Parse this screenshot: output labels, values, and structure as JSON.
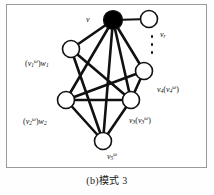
{
  "figure": {
    "caption": "(b)模式 3",
    "panel_border_color": "#9a9a9a",
    "background_color": "#ffffff",
    "node_stroke_color": "#111111",
    "node_fill_color": "#ffffff",
    "filled_node_color": "#000000",
    "edge_color": "#111111"
  },
  "graph_data": {
    "type": "node-link-diagram",
    "nodes": [
      {
        "id": "v",
        "label": "v",
        "label_html": "v",
        "cx": 106,
        "cy": 15,
        "r": 9.5,
        "filled": true,
        "label_x": 79,
        "label_y": 11
      },
      {
        "id": "vr",
        "label": "vr",
        "label_html": "v<sub>r</sub>",
        "cx": 142,
        "cy": 14,
        "r": 8.5,
        "filled": false,
        "label_x": 153,
        "label_y": 26
      },
      {
        "id": "w1",
        "label": "(v1^w)w1",
        "label_html": "<span class=\"paren\">(</span>v<sub>1</sub><sup>ω</sup><span class=\"paren\">)</span>w<sub>1</sub>",
        "cx": 64,
        "cy": 44,
        "r": 8.5,
        "filled": false,
        "label_x": 18,
        "label_y": 54
      },
      {
        "id": "v4",
        "label": "v4(v4^w)",
        "label_html": "v<sub>4</sub><span class=\"paren\">(</span>v<sub>4</sub><sup>ω</sup><span class=\"paren\">)</span>",
        "cx": 137,
        "cy": 66,
        "r": 8.5,
        "filled": false,
        "label_x": 150,
        "label_y": 80
      },
      {
        "id": "w2",
        "label": "(v2^w)w2",
        "label_html": "<span class=\"paren\">(</span>v<sub>2</sub><sup>ω</sup><span class=\"paren\">)</span>w<sub>2</sub>",
        "cx": 59,
        "cy": 95,
        "r": 8.5,
        "filled": false,
        "label_x": 16,
        "label_y": 112
      },
      {
        "id": "v3",
        "label": "v3(v3^w)",
        "label_html": "v<sub>3</sub><span class=\"paren\">(</span>v<sub>3</sub><sup>ω</sup><span class=\"paren\">)</span>",
        "cx": 124,
        "cy": 95,
        "r": 8.5,
        "filled": false,
        "label_x": 122,
        "label_y": 111
      },
      {
        "id": "v5",
        "label": "v5^w",
        "label_html": "v<sub>5</sub><sup>ω</sup>",
        "cx": 96,
        "cy": 136,
        "r": 8.5,
        "filled": false,
        "label_x": 100,
        "label_y": 147
      }
    ],
    "edges": [
      {
        "source": "v",
        "target": "vr"
      },
      {
        "source": "v",
        "target": "w1"
      },
      {
        "source": "v",
        "target": "v4"
      },
      {
        "source": "v",
        "target": "w2"
      },
      {
        "source": "v",
        "target": "v3"
      },
      {
        "source": "v",
        "target": "v5"
      },
      {
        "source": "w1",
        "target": "v3"
      },
      {
        "source": "w1",
        "target": "v5"
      },
      {
        "source": "w2",
        "target": "v4"
      },
      {
        "source": "w2",
        "target": "v3"
      },
      {
        "source": "w2",
        "target": "v5"
      },
      {
        "source": "v3",
        "target": "v4"
      },
      {
        "source": "v3",
        "target": "v5"
      }
    ],
    "ellipsis": {
      "label": "vertical-ellipsis",
      "dots": 3,
      "x": 145,
      "y": 32
    }
  }
}
